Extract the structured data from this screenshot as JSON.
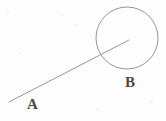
{
  "figure": {
    "background_color": "#fdfdfd",
    "stroke_color": "#8a8a8a",
    "label_color": "#4a4a4a",
    "width": 166,
    "height": 121,
    "labels": [
      {
        "id": "A",
        "text": "A",
        "x": 27,
        "y": 97
      },
      {
        "id": "B",
        "text": "B",
        "x": 125,
        "y": 75
      }
    ],
    "circle": {
      "name": "circle-b",
      "center_x": 127,
      "center_y": 38,
      "radius": 31,
      "stroke_width": 0.9
    },
    "line": {
      "name": "segment-a-to-center",
      "x1": 9,
      "y1": 102,
      "x2": 129,
      "y2": 40,
      "stroke_width": 0.9
    }
  }
}
